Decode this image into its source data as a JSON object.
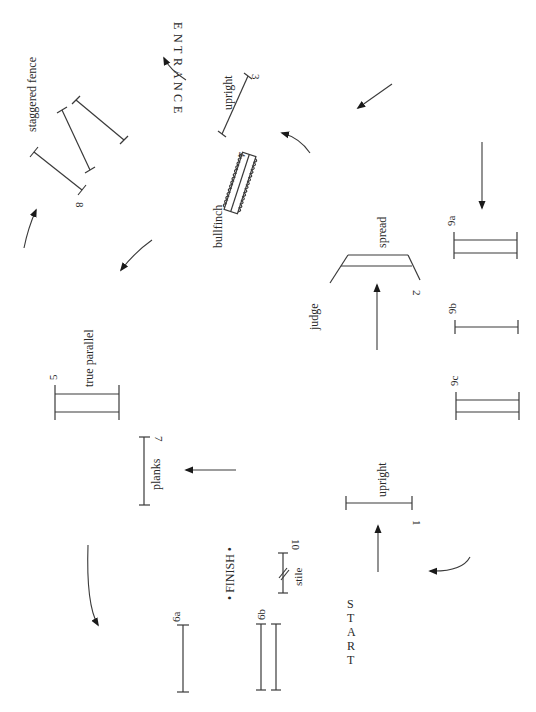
{
  "diagram": {
    "type": "show-jumping course plan",
    "orientation": "rotated 90 degrees clockwise",
    "colors": {
      "ink": "#2a2a2a",
      "background": "#ffffff"
    }
  },
  "markers": {
    "entrance": [
      "E",
      "N",
      "T",
      "R",
      "A",
      "N",
      "C",
      "E"
    ],
    "start": [
      "S",
      "T",
      "A",
      "R",
      "T"
    ],
    "finish": "• FINISH •"
  },
  "fences": [
    {
      "number": "1",
      "name": "upright"
    },
    {
      "number": "2",
      "name": "spread"
    },
    {
      "number": "3",
      "name": "upright"
    },
    {
      "number": "4",
      "name": "bullfinch"
    },
    {
      "number": "5",
      "name": "true parallel"
    },
    {
      "number": "6a",
      "name": ""
    },
    {
      "number": "6b",
      "name": ""
    },
    {
      "number": "7",
      "name": "planks"
    },
    {
      "number": "8",
      "name": "staggered fence"
    },
    {
      "number": "9a",
      "name": ""
    },
    {
      "number": "9b",
      "name": ""
    },
    {
      "number": "9c",
      "name": ""
    },
    {
      "number": "10",
      "name": "stile"
    }
  ],
  "other_labels": {
    "judge": "judge"
  }
}
